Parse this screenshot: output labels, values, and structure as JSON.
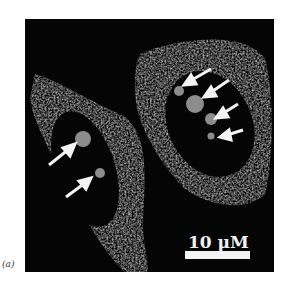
{
  "figure": {
    "panel_label": "(a)",
    "scale_bar": {
      "label": "10 μM"
    },
    "cells": [
      {
        "name": "left-cell",
        "arrows": 2
      },
      {
        "name": "right-cell",
        "arrows": 4
      }
    ],
    "colors": {
      "background": "#050505",
      "cytoplasm": "#7a7a7a",
      "arrow": "#f4f4f4"
    }
  }
}
